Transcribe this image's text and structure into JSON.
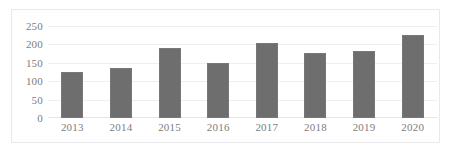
{
  "chart_data": {
    "type": "bar",
    "title": "",
    "subtitle": "",
    "xlabel": "",
    "ylabel": "",
    "categories": [
      "2013",
      "2014",
      "2015",
      "2016",
      "2017",
      "2018",
      "2019",
      "2020"
    ],
    "values": [
      125,
      135,
      190,
      150,
      205,
      178,
      183,
      225
    ],
    "ylim": [
      0,
      250
    ],
    "yticks": [
      "0",
      "50",
      "100",
      "150",
      "200",
      "250"
    ],
    "ytick_values": [
      0,
      50,
      100,
      150,
      200,
      250
    ],
    "grid": true,
    "legend": false,
    "legend_position": "none",
    "series": [
      {
        "name": "",
        "values": [
          125,
          135,
          190,
          150,
          205,
          178,
          183,
          225
        ],
        "color": "#6e6e6e"
      }
    ]
  },
  "colors": {
    "bar_fill": "#6e6e6e",
    "bar_stroke": "#777777",
    "gridline": "#eceff3",
    "axis": "#e3e6ea",
    "tick_text": "#7d7d7d",
    "frame_border": "#e9e9ed",
    "background": "#ffffff"
  }
}
